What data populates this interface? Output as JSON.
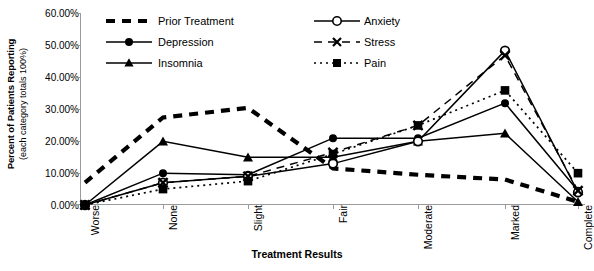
{
  "chart_data": {
    "type": "line",
    "title": "",
    "xlabel": "Treatment Results",
    "ylabel": "Percent of Patients Reporting",
    "ylabel_sub": "(each category totals 100%)",
    "categories": [
      "Worse",
      "None",
      "Slight",
      "Fair",
      "Moderate",
      "Marked",
      "Complete"
    ],
    "ylim": [
      0,
      60
    ],
    "ytick_labels": [
      "0.00%",
      "10.00%",
      "20.00%",
      "30.00%",
      "40.00%",
      "50.00%",
      "60.00%"
    ],
    "ytick_values": [
      0,
      10,
      20,
      30,
      40,
      50,
      60
    ],
    "grid": false,
    "legend_position": "top-center",
    "series": [
      {
        "name": "Prior Treatment",
        "style": "thick-dashed",
        "marker": "none",
        "color": "#000000",
        "values": [
          7.0,
          27.5,
          30.5,
          11.5,
          9.5,
          8.0,
          1.0
        ]
      },
      {
        "name": "Depression",
        "style": "solid",
        "marker": "filled-circle",
        "color": "#000000",
        "values": [
          0.0,
          10.0,
          9.5,
          21.0,
          21.0,
          32.0,
          4.5
        ]
      },
      {
        "name": "Insomnia",
        "style": "solid",
        "marker": "filled-triangle",
        "color": "#000000",
        "values": [
          0.0,
          20.0,
          15.0,
          15.0,
          20.0,
          22.5,
          1.0
        ]
      },
      {
        "name": "Anxiety",
        "style": "solid",
        "marker": "open-circle",
        "color": "#000000",
        "values": [
          0.0,
          7.0,
          9.0,
          13.0,
          20.0,
          48.5,
          4.0
        ]
      },
      {
        "name": "Stress",
        "style": "dashed",
        "marker": "cross-x",
        "color": "#000000",
        "values": [
          0.0,
          7.0,
          9.0,
          16.5,
          25.0,
          47.0,
          4.5
        ]
      },
      {
        "name": "Pain",
        "style": "dotted",
        "marker": "filled-square",
        "color": "#000000",
        "values": [
          0.0,
          5.0,
          7.5,
          16.0,
          25.0,
          36.0,
          10.0
        ]
      }
    ]
  },
  "legend": {
    "items": [
      {
        "label": "Prior Treatment"
      },
      {
        "label": "Depression"
      },
      {
        "label": "Insomnia"
      },
      {
        "label": "Anxiety"
      },
      {
        "label": "Stress"
      },
      {
        "label": "Pain"
      }
    ]
  }
}
